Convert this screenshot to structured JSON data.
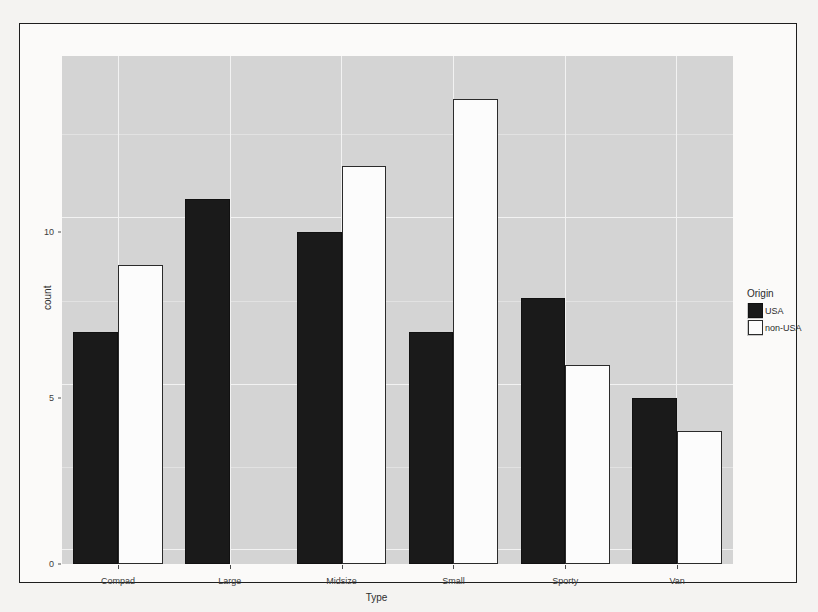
{
  "chart_data": {
    "type": "bar",
    "title": "",
    "xlabel": "Type",
    "ylabel": "count",
    "categories": [
      "Compad",
      "Large",
      "Midsize",
      "Small",
      "Sporty",
      "Van"
    ],
    "series": [
      {
        "name": "USA",
        "color": "#1a1a1a",
        "values": [
          7,
          11,
          10,
          7,
          8,
          5
        ]
      },
      {
        "name": "non-USA",
        "color": "#ffffff",
        "values": [
          9,
          0,
          12,
          14,
          6,
          4
        ]
      }
    ],
    "legend": {
      "title": "Origin",
      "position": "right",
      "entries": [
        "USA",
        "non-USA"
      ]
    },
    "ylim": [
      0,
      15.3
    ],
    "y_ticks": [
      0,
      5,
      10
    ],
    "y_tick_labels": [
      "0",
      "5",
      "10"
    ],
    "grid": true,
    "panel_background": "#d4d4d4",
    "grid_major_color": "#f2f2f2",
    "grid_minor_color": "#e2e2e2"
  },
  "axes": {
    "y_title": "count",
    "x_title": "Type"
  }
}
